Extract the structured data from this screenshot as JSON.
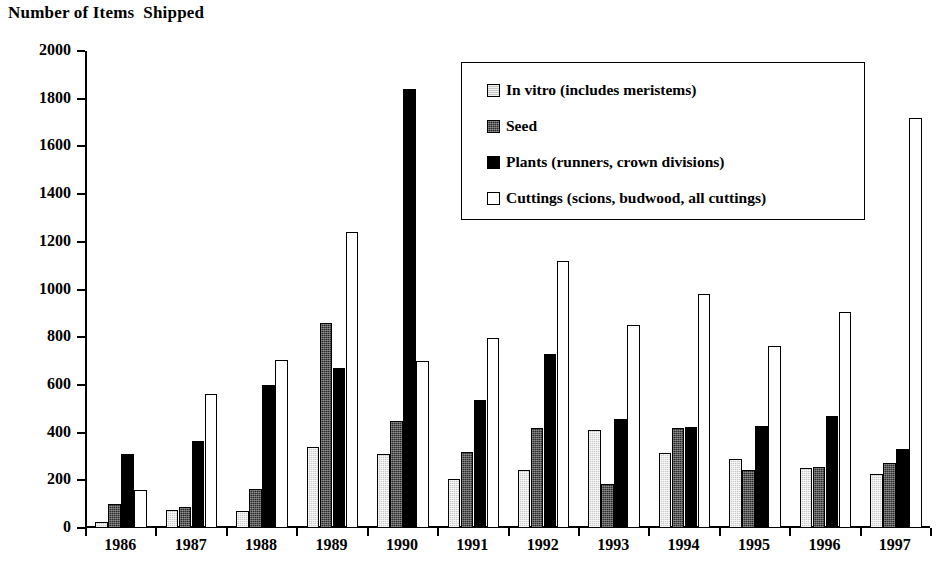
{
  "chart_data": {
    "type": "bar",
    "title": "Number of Items  Shipped",
    "xlabel": "",
    "ylabel": "",
    "ylim": [
      0,
      2000
    ],
    "ytick_step": 200,
    "yticks": [
      0,
      200,
      400,
      600,
      800,
      1000,
      1200,
      1400,
      1600,
      1800,
      2000
    ],
    "grid": false,
    "legend_position": "top-right (inside plot)",
    "categories": [
      "1986",
      "1987",
      "1988",
      "1989",
      "1990",
      "1991",
      "1992",
      "1993",
      "1994",
      "1995",
      "1996",
      "1997"
    ],
    "series": [
      {
        "name": "In vitro (includes meristems)",
        "color": "#c9c9c9",
        "swatch": "light-gray-hatched",
        "values": [
          25,
          75,
          70,
          340,
          312,
          205,
          245,
          412,
          315,
          290,
          250,
          228
        ]
      },
      {
        "name": "Seed",
        "color": "#2b2b2b",
        "swatch": "dark-gray-hatched",
        "values": [
          100,
          90,
          165,
          860,
          450,
          320,
          420,
          185,
          420,
          245,
          255,
          272
        ]
      },
      {
        "name": "Plants (runners, crown divisions)",
        "color": "#000000",
        "swatch": "solid-black",
        "values": [
          310,
          365,
          600,
          670,
          1840,
          538,
          730,
          455,
          425,
          428,
          470,
          330
        ]
      },
      {
        "name": "Cuttings (scions, budwood, all cuttings)",
        "color": "#ffffff",
        "swatch": "white-outlined",
        "values": [
          160,
          560,
          705,
          1240,
          700,
          798,
          1120,
          852,
          980,
          765,
          905,
          1720
        ]
      }
    ]
  },
  "legend": {
    "items": [
      {
        "label": "In vitro (includes meristems)",
        "swatch": "invitro"
      },
      {
        "label": "Seed",
        "swatch": "seed"
      },
      {
        "label": "Plants (runners, crown divisions)",
        "swatch": "plants"
      },
      {
        "label": "Cuttings (scions, budwood, all cuttings)",
        "swatch": "cuttings"
      }
    ]
  }
}
